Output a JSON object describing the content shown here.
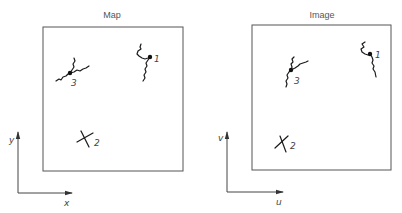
{
  "panels": [
    {
      "id": "map",
      "title": "Map",
      "axes": {
        "horizontal": "x",
        "vertical": "y"
      },
      "points": [
        {
          "label": "1",
          "type": "junction"
        },
        {
          "label": "2",
          "type": "cross"
        },
        {
          "label": "3",
          "type": "junction"
        }
      ]
    },
    {
      "id": "image",
      "title": "Image",
      "axes": {
        "horizontal": "u",
        "vertical": "v"
      },
      "points": [
        {
          "label": "1",
          "type": "junction"
        },
        {
          "label": "2",
          "type": "cross"
        },
        {
          "label": "3",
          "type": "junction"
        }
      ]
    }
  ],
  "colors": {
    "line": "#1a1a1a",
    "frame": "#555555",
    "text": "#555555"
  }
}
